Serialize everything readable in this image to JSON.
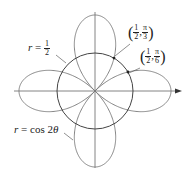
{
  "diagram": {
    "title": "",
    "curves": [
      {
        "name": "circle",
        "equation_lhs": "r",
        "equation_rhs_num": "1",
        "equation_rhs_den": "2",
        "color": "#555555"
      },
      {
        "name": "rose",
        "equation": "r = cos 2θ",
        "equation_lhs": "r",
        "equation_rhs": "cos 2",
        "equation_var": "θ",
        "color": "#666666"
      }
    ],
    "points": [
      {
        "label_r_num": "1",
        "label_r_den": "2",
        "label_theta_num": "π",
        "label_theta_den": "3"
      },
      {
        "label_r_num": "1",
        "label_r_den": "2",
        "label_theta_num": "π",
        "label_theta_den": "6"
      }
    ],
    "axes": {
      "horizontal_arrow": true
    }
  }
}
